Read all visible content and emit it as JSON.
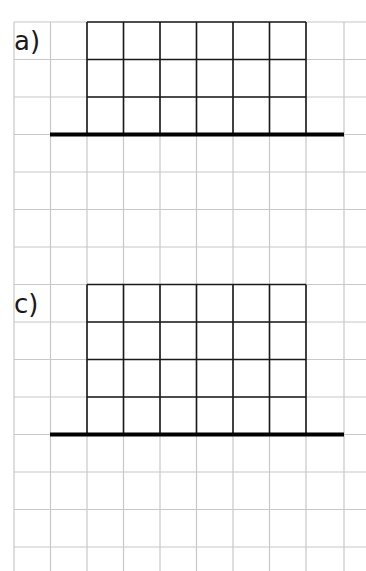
{
  "worksheet": {
    "background_grid": {
      "color": "#c8c8c8",
      "x_lines": [
        14,
        50.5,
        87,
        123.5,
        160,
        196.5,
        233,
        269.5,
        306,
        344
      ],
      "y_lines": [
        22,
        59.5,
        97,
        134.5,
        172,
        209.5,
        247,
        284.5,
        322,
        359.5,
        397,
        434.5,
        472,
        509.5,
        547
      ],
      "top": 22,
      "bottom": 571,
      "left": 14,
      "right": 366
    },
    "figures": [
      {
        "label": "a)",
        "label_x": 14,
        "label_y": 28,
        "grid_color": "#1a1a1a",
        "columns": 6,
        "rows": 3,
        "x": 87,
        "y": 22,
        "cell_w": 36.5,
        "cell_h": 37.5,
        "baseline": {
          "x1": 50,
          "x2": 344,
          "y": 134.5,
          "thickness": 4,
          "color": "#000000"
        }
      },
      {
        "label": "c)",
        "label_x": 14,
        "label_y": 291,
        "grid_color": "#1a1a1a",
        "columns": 6,
        "rows": 4,
        "x": 87,
        "y": 284.5,
        "cell_w": 36.5,
        "cell_h": 37.5,
        "baseline": {
          "x1": 50,
          "x2": 344,
          "y": 434.5,
          "thickness": 4,
          "color": "#000000"
        }
      }
    ]
  }
}
